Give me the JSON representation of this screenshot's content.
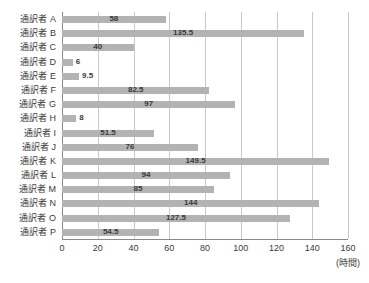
{
  "chart_data": {
    "type": "bar",
    "orientation": "horizontal",
    "title": "",
    "subtitle": "",
    "xlabel": "(時間)",
    "ylabel": "",
    "xlim": [
      0,
      160
    ],
    "xticks": [
      0,
      20,
      40,
      60,
      80,
      100,
      120,
      140,
      160
    ],
    "xtick_labels": [
      "0",
      "20",
      "40",
      "60",
      "80",
      "100",
      "120",
      "140",
      "160"
    ],
    "grid": true,
    "grid_axis": "x",
    "legend": false,
    "legend_position": "none",
    "bar_color": "#b3b3b3",
    "grid_color": "#c9c9c9",
    "axis_color": "#8a8a8a",
    "text_color": "#3b3b3b",
    "categories": [
      "通訳者 A",
      "通訳者 B",
      "通訳者 C",
      "通訳者 D",
      "通訳者 E",
      "通訳者 F",
      "通訳者 G",
      "通訳者 H",
      "通訳者 I",
      "通訳者 J",
      "通訳者 K",
      "通訳者 L",
      "通訳者 M",
      "通訳者 N",
      "通訳者 O",
      "通訳者 P"
    ],
    "values": [
      58,
      135.5,
      40,
      6,
      9.5,
      82.5,
      97,
      8,
      51.5,
      76,
      149.5,
      94,
      85,
      144,
      127.5,
      54.5
    ],
    "value_labels": [
      "58",
      "135.5",
      "40",
      "6",
      "9.5",
      "82.5",
      "97",
      "8",
      "51.5",
      "76",
      "149.5",
      "94",
      "85",
      "144",
      "127.5",
      "54.5"
    ],
    "unit_note": "(時間)"
  }
}
